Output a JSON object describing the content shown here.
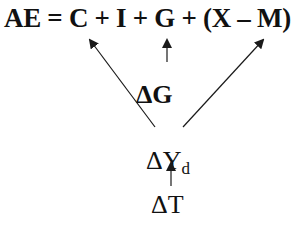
{
  "diagram": {
    "equation": "AE = C + I + G + (X – M)",
    "delta_g": "ΔG",
    "delta_y": "ΔY",
    "delta_y_sub": "d",
    "delta_t": "ΔT",
    "arrows": [
      {
        "from": "ΔY_d",
        "to": "C"
      },
      {
        "from": "ΔG",
        "to": "G"
      },
      {
        "from": "ΔY_d",
        "to": "(X – M)"
      },
      {
        "from": "ΔT",
        "to": "ΔY_d"
      }
    ],
    "line_color": "#1a1a1a"
  }
}
